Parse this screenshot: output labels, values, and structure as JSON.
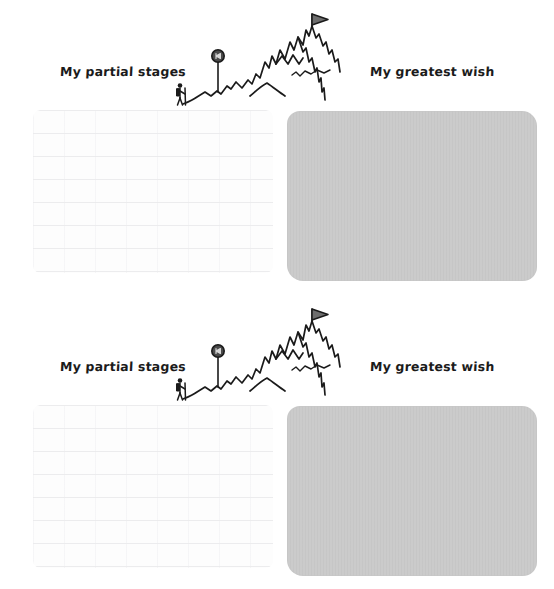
{
  "document": {
    "type": "printable-worksheet",
    "copies": 2,
    "background_color": "#ffffff"
  },
  "palette": {
    "ink": "#1b1b1b",
    "wish_box_fill": "#cacaca",
    "writing_area_rule": "#e9e9eb",
    "marker_fill": "#4a4a4a",
    "flag_fill": "#6e6e6e"
  },
  "worksheet": {
    "left_label": "My partial stages",
    "right_label": "My greatest wish",
    "illustration_name": "mountain-with-summit-flag",
    "illustration_elements": [
      "hiker-stick-figure",
      "milestone-marker-pole",
      "mountain-ridge-line",
      "summit-flag"
    ],
    "left_area_name": "partial-stages-writing-area",
    "right_area_name": "greatest-wish-drawing-box"
  },
  "sections": [
    {
      "index": 1,
      "left_label": "My partial stages",
      "right_label": "My greatest wish"
    },
    {
      "index": 2,
      "left_label": "My partial stages",
      "right_label": "My greatest wish"
    }
  ]
}
